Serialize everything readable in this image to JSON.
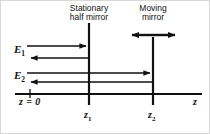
{
  "figure": {
    "type": "optics-schematic",
    "background_color": "#ffffff",
    "line_color": "#111111"
  },
  "labels": {
    "stationary_mirror": {
      "line1": "Stationary",
      "line2": "half mirror"
    },
    "moving_mirror": {
      "line1": "Moving",
      "line2": "mirror"
    },
    "field_1": "E",
    "field_1_sub": "1",
    "field_2": "E",
    "field_2_sub": "2",
    "origin": "z = 0",
    "axis": "z",
    "position_1": "z",
    "position_1_sub": "1",
    "position_2": "z",
    "position_2_sub": "2"
  },
  "geometry": {
    "axis_y": 93,
    "axis_x_start": 14,
    "axis_x_end": 200,
    "mirror_1_x": 88,
    "mirror_2_x": 152,
    "mirror_1_top": 22,
    "mirror_2_top": 36,
    "mirror_bottom": 103,
    "origin_tick_x": 29,
    "beam_e1_forward_y": 45,
    "beam_e1_backward_y": 57,
    "beam_e2_forward_y": 72,
    "beam_e2_backward_y": 81,
    "beam_left_x": 26,
    "motion_arrow_y": 34,
    "motion_arrow_left_x": 130,
    "motion_arrow_right_x": 175
  }
}
